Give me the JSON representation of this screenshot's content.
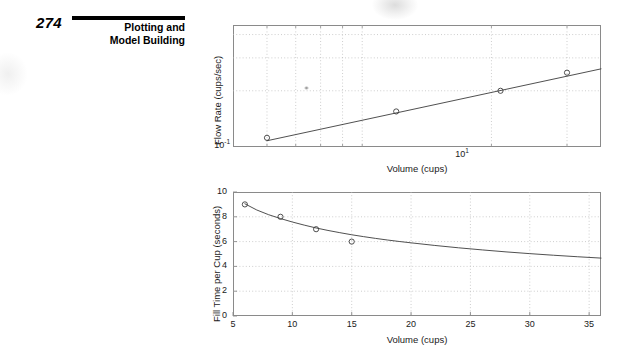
{
  "page": {
    "number": "274",
    "running_head_line1": "Plotting and",
    "running_head_line2": "Model Building"
  },
  "figure": {
    "label": "Figure 5.5–7",
    "caption_line1": "Flow rate and fill time for a",
    "caption_line2": "coffee pot."
  },
  "colors": {
    "axis": "#8a8a8a",
    "grid": "#b8b8b8",
    "data": "#3c3c3c",
    "text": "#1a1a1a",
    "rule": "#000000"
  },
  "chart_data": [
    {
      "id": "flow-rate",
      "type": "scatter",
      "title": "",
      "xlabel": "Volume (cups)",
      "ylabel": "Flow Rate (cups/sec)",
      "xscale": "log",
      "yscale": "log",
      "xlim": [
        5,
        36
      ],
      "ylim": [
        0.1,
        0.45
      ],
      "xticks": [
        10
      ],
      "xticklabels": [
        "10^1"
      ],
      "yticks": [
        0.1
      ],
      "yticklabels": [
        "10^-1"
      ],
      "xminorgrid": [
        6,
        7,
        8,
        9,
        10,
        20,
        30
      ],
      "yminorgrid": [
        0.2,
        0.3,
        0.4
      ],
      "grid": true,
      "x": [
        6,
        12,
        21,
        30
      ],
      "y": [
        0.112,
        0.155,
        0.2,
        0.25
      ],
      "marker": "circle-open",
      "fit_label": "power-law least squares fit",
      "fit_x": [
        6,
        36
      ],
      "fit_y": [
        0.108,
        0.262
      ]
    },
    {
      "id": "fill-time",
      "type": "scatter",
      "title": "",
      "xlabel": "Volume (cups)",
      "ylabel": "Fill Time per Cup (seconds)",
      "xscale": "linear",
      "yscale": "linear",
      "xlim": [
        5,
        36
      ],
      "ylim": [
        0,
        10
      ],
      "xticks": [
        5,
        10,
        15,
        20,
        25,
        30,
        35
      ],
      "xticklabels": [
        "5",
        "10",
        "15",
        "20",
        "25",
        "30",
        "35"
      ],
      "yticks": [
        0,
        2,
        4,
        6,
        8,
        10
      ],
      "yticklabels": [
        "0",
        "2",
        "4",
        "6",
        "8",
        "10"
      ],
      "grid": true,
      "x": [
        6,
        9,
        12,
        15
      ],
      "y": [
        9.0,
        8.0,
        7.0,
        6.0
      ],
      "marker": "circle-open",
      "fit_label": "power-law decay curve",
      "fit_points": [
        [
          6,
          9.05
        ],
        [
          7,
          8.55
        ],
        [
          8,
          8.17
        ],
        [
          9,
          7.86
        ],
        [
          10,
          7.58
        ],
        [
          11,
          7.33
        ],
        [
          12,
          7.1
        ],
        [
          13,
          6.9
        ],
        [
          14,
          6.72
        ],
        [
          15,
          6.55
        ],
        [
          16,
          6.4
        ],
        [
          17,
          6.26
        ],
        [
          18,
          6.13
        ],
        [
          19,
          6.01
        ],
        [
          20,
          5.9
        ],
        [
          22,
          5.69
        ],
        [
          24,
          5.5
        ],
        [
          26,
          5.33
        ],
        [
          28,
          5.17
        ],
        [
          30,
          5.03
        ],
        [
          32,
          4.9
        ],
        [
          34,
          4.78
        ],
        [
          36,
          4.67
        ]
      ]
    }
  ]
}
